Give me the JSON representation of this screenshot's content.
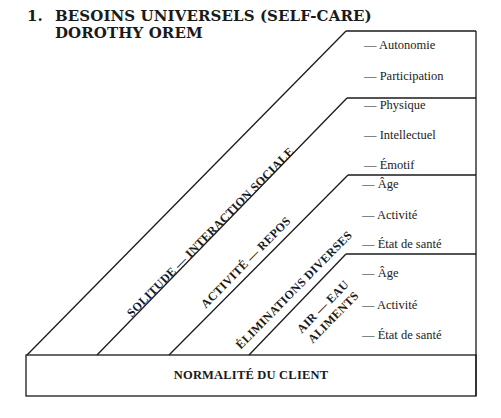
{
  "title": {
    "number": "1.",
    "line1": "BESOINS UNIVERSELS (SELF-CARE)",
    "line2": "DOROTHY OREM"
  },
  "bands": [
    {
      "label": "SOLITUDE — INTERACTION SOCIALE",
      "items": [
        "— Autonomie",
        "— Participation"
      ]
    },
    {
      "label": "ACTIVITÉ — REPOS",
      "items": [
        "— Physique",
        "— Intellectuel",
        "— Émotif"
      ]
    },
    {
      "label": "ÉLIMINATIONS DIVERSES",
      "items": [
        "— Âge",
        "— Activité",
        "— État de santé"
      ]
    },
    {
      "label_line1": "AIR — EAU",
      "label_line2": "ALIMENTS",
      "items": [
        "— Âge",
        "— Activité",
        "— État de santé"
      ]
    }
  ],
  "base": {
    "label": "NORMALITÉ DU CLIENT"
  },
  "colors": {
    "line": "#1a1a1a",
    "background": "#ffffff"
  }
}
